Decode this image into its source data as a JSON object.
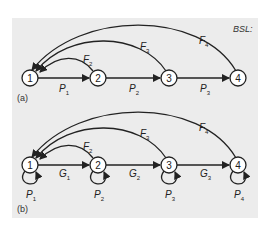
{
  "title": "BSL:",
  "panel_a": {
    "label": "(a)",
    "nodes": [
      "1",
      "2",
      "3",
      "4"
    ],
    "forward_edges": [
      {
        "from": "1",
        "to": "2",
        "label": "P",
        "sub": "1"
      },
      {
        "from": "2",
        "to": "3",
        "label": "P",
        "sub": "2"
      },
      {
        "from": "3",
        "to": "4",
        "label": "P",
        "sub": "3"
      }
    ],
    "feedback_edges": [
      {
        "from": "2",
        "to": "1",
        "label": "F",
        "sub": "2"
      },
      {
        "from": "3",
        "to": "1",
        "label": "F",
        "sub": "3"
      },
      {
        "from": "4",
        "to": "1",
        "label": "F",
        "sub": "4"
      }
    ]
  },
  "panel_b": {
    "label": "(b)",
    "nodes": [
      "1",
      "2",
      "3",
      "4"
    ],
    "forward_edges": [
      {
        "from": "1",
        "to": "2",
        "label": "G",
        "sub": "1"
      },
      {
        "from": "2",
        "to": "3",
        "label": "G",
        "sub": "2"
      },
      {
        "from": "3",
        "to": "4",
        "label": "G",
        "sub": "3"
      }
    ],
    "feedback_edges": [
      {
        "from": "2",
        "to": "1",
        "label": "F",
        "sub": "2"
      },
      {
        "from": "3",
        "to": "1",
        "label": "F",
        "sub": "3"
      },
      {
        "from": "4",
        "to": "1",
        "label": "F",
        "sub": "4"
      }
    ],
    "self_loops": [
      {
        "node": "1",
        "label": "P",
        "sub": "1"
      },
      {
        "node": "2",
        "label": "P",
        "sub": "2"
      },
      {
        "node": "3",
        "label": "P",
        "sub": "3"
      },
      {
        "node": "4",
        "label": "P",
        "sub": "4"
      }
    ]
  },
  "colors": {
    "background": "#ececec",
    "stroke": "#222222",
    "node_fill": "#ffffff"
  }
}
